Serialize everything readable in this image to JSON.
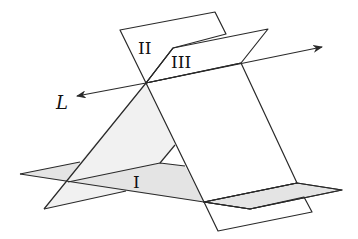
{
  "figure": {
    "colors": {
      "plane_I": "#e4e4e4",
      "plane_II": "#d5d5d5",
      "plane_III": "#f1f1f1",
      "edge": "#2a2a2a",
      "background": "#ffffff"
    },
    "labels": {
      "plane_I": "I",
      "plane_II": "II",
      "plane_III": "III",
      "line": "L"
    }
  }
}
